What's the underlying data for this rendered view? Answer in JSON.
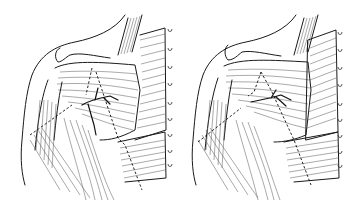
{
  "figure": {
    "panels": [
      {
        "id": "left",
        "label": "",
        "incision_style": "dashed",
        "hooks": 9
      },
      {
        "id": "right",
        "label": "",
        "incision_style": "dashed",
        "hooks": 9
      }
    ],
    "colors": {
      "ink": "#1a1a1a",
      "background": "#ffffff"
    }
  }
}
